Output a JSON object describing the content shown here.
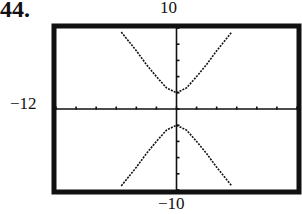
{
  "problem_number": "44.",
  "chart_data": {
    "type": "line",
    "title": "",
    "xlabel": "",
    "ylabel": "",
    "window": {
      "xmin": -12,
      "xmax": 12,
      "ymin": -10,
      "ymax": 10
    },
    "visible_labels": {
      "ymax": "10",
      "ymin": "-10",
      "xmin": "-12"
    },
    "xlim": [
      -12,
      12
    ],
    "ylim": [
      -10,
      10
    ],
    "x_tick_spacing": 2,
    "y_tick_spacing": 2,
    "grid": false,
    "series": [
      {
        "name": "upper branch",
        "description": "hyperbola upper branch, vertex near (0, 2)",
        "x": [
          -5.5,
          -4,
          -3,
          -2,
          -1,
          0,
          1,
          2,
          3,
          4,
          5.5
        ],
        "y": [
          9.5,
          7.2,
          5.5,
          4.0,
          2.6,
          2.0,
          2.6,
          4.0,
          5.5,
          7.2,
          9.5
        ]
      },
      {
        "name": "lower branch",
        "description": "hyperbola lower branch, vertex near (0, -2)",
        "x": [
          -5.5,
          -4,
          -3,
          -2,
          -1,
          0,
          1,
          2,
          3,
          4,
          5.5
        ],
        "y": [
          -9.5,
          -7.2,
          -5.5,
          -4.0,
          -2.6,
          -2.0,
          -2.6,
          -4.0,
          -5.5,
          -7.2,
          -9.5
        ]
      }
    ]
  }
}
